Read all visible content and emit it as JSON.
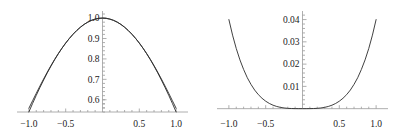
{
  "figure": {
    "background_color": "#ffffff",
    "curve_color": "#2b2b2b",
    "axis_color": "#9a9a9a",
    "tick_color": "#9a9a9a",
    "label_color": "#1a1a1a"
  },
  "chart_data": [
    {
      "id": "left-plot",
      "type": "line",
      "title": "",
      "xlabel": "",
      "ylabel": "",
      "xlim": [
        -1.08,
        1.08
      ],
      "ylim": [
        0.54,
        1.02
      ],
      "grid": false,
      "legend": "none",
      "axis_style": "crossing-axes-at-origin",
      "x_ticks": [
        -1.0,
        -0.5,
        0.5,
        1.0
      ],
      "x_tick_labels": [
        "-1.0",
        "-0.5",
        "0.5",
        "1.0"
      ],
      "y_ticks": [
        0.6,
        0.7,
        0.8,
        0.9,
        1.0
      ],
      "y_tick_labels": [
        "0.6",
        "0.7",
        "0.8",
        "0.9",
        "1.0"
      ],
      "series": [
        {
          "name": "curve-1",
          "x": [
            -1.0,
            -0.95,
            -0.9,
            -0.85,
            -0.8,
            -0.75,
            -0.7,
            -0.65,
            -0.6,
            -0.55,
            -0.5,
            -0.45,
            -0.4,
            -0.35,
            -0.3,
            -0.25,
            -0.2,
            -0.15,
            -0.1,
            -0.05,
            0.0,
            0.05,
            0.1,
            0.15,
            0.2,
            0.25,
            0.3,
            0.35,
            0.4,
            0.45,
            0.5,
            0.55,
            0.6,
            0.65,
            0.7,
            0.75,
            0.8,
            0.85,
            0.9,
            0.95,
            1.0
          ],
          "y": [
            0.5403,
            0.5817,
            0.6216,
            0.66,
            0.6967,
            0.7317,
            0.7648,
            0.7961,
            0.8253,
            0.8525,
            0.8776,
            0.9004,
            0.9211,
            0.9394,
            0.9553,
            0.9689,
            0.9801,
            0.9888,
            0.995,
            0.9988,
            1.0,
            0.9988,
            0.995,
            0.9888,
            0.9801,
            0.9689,
            0.9553,
            0.9394,
            0.9211,
            0.9004,
            0.8776,
            0.8525,
            0.8253,
            0.7961,
            0.7648,
            0.7317,
            0.6967,
            0.66,
            0.6216,
            0.5817,
            0.5403
          ]
        },
        {
          "name": "curve-2",
          "x": [
            -1.0,
            -0.95,
            -0.9,
            -0.85,
            -0.8,
            -0.75,
            -0.7,
            -0.65,
            -0.6,
            -0.55,
            -0.5,
            -0.45,
            -0.4,
            -0.35,
            -0.3,
            -0.25,
            -0.2,
            -0.15,
            -0.1,
            -0.05,
            0.0,
            0.05,
            0.1,
            0.15,
            0.2,
            0.25,
            0.3,
            0.35,
            0.4,
            0.45,
            0.5,
            0.55,
            0.6,
            0.65,
            0.7,
            0.75,
            0.8,
            0.85,
            0.9,
            0.95,
            1.0
          ],
          "y": [
            0.5583,
            0.5949,
            0.6313,
            0.667,
            0.7018,
            0.7353,
            0.7674,
            0.7978,
            0.8264,
            0.853,
            0.8776,
            0.9002,
            0.9207,
            0.9391,
            0.9553,
            0.9691,
            0.9803,
            0.9889,
            0.995,
            0.9988,
            1.0,
            0.9988,
            0.995,
            0.9889,
            0.9803,
            0.9691,
            0.9553,
            0.9391,
            0.9207,
            0.9002,
            0.8776,
            0.853,
            0.8264,
            0.7978,
            0.7674,
            0.7353,
            0.7018,
            0.667,
            0.6313,
            0.5949,
            0.5583
          ]
        }
      ]
    },
    {
      "id": "right-plot",
      "type": "line",
      "title": "",
      "xlabel": "",
      "ylabel": "",
      "xlim": [
        -1.08,
        1.08
      ],
      "ylim": [
        -0.0015,
        0.0425
      ],
      "grid": false,
      "legend": "none",
      "axis_style": "crossing-axes-at-origin",
      "x_ticks": [
        -1.0,
        -0.5,
        0.5,
        1.0
      ],
      "x_tick_labels": [
        "-1.0",
        "-0.5",
        "0.5",
        "1.0"
      ],
      "y_ticks": [
        0.01,
        0.02,
        0.03,
        0.04
      ],
      "y_tick_labels": [
        "0.01",
        "0.02",
        "0.03",
        "0.04"
      ],
      "series": [
        {
          "name": "error-curve",
          "x": [
            -1.0,
            -0.95,
            -0.9,
            -0.85,
            -0.8,
            -0.75,
            -0.7,
            -0.65,
            -0.6,
            -0.55,
            -0.5,
            -0.45,
            -0.4,
            -0.35,
            -0.3,
            -0.25,
            -0.2,
            -0.15,
            -0.1,
            -0.05,
            0.0,
            0.05,
            0.1,
            0.15,
            0.2,
            0.25,
            0.3,
            0.35,
            0.4,
            0.45,
            0.5,
            0.55,
            0.6,
            0.65,
            0.7,
            0.75,
            0.8,
            0.85,
            0.9,
            0.95,
            1.0
          ],
          "y": [
            0.04,
            0.033,
            0.027,
            0.0219,
            0.0176,
            0.0139,
            0.0109,
            0.00836,
            0.00631,
            0.00466,
            0.00335,
            0.00233,
            0.00155,
            0.000979,
            0.00058,
            0.000314,
            0.00015,
            5.98e-05,
            1.77e-05,
            2.28e-06,
            0.0,
            2.28e-06,
            1.77e-05,
            5.98e-05,
            0.00015,
            0.000314,
            0.00058,
            0.000979,
            0.00155,
            0.00233,
            0.00335,
            0.00466,
            0.00631,
            0.00836,
            0.0109,
            0.0139,
            0.0176,
            0.0219,
            0.027,
            0.033,
            0.04
          ]
        }
      ]
    }
  ]
}
